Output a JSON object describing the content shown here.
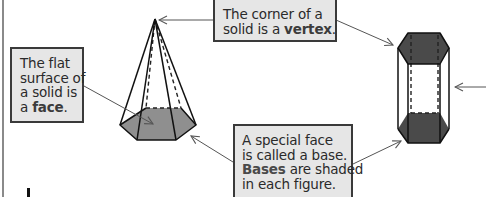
{
  "callouts": {
    "vertex": {
      "line1": "The corner of a",
      "line2_pre": "solid is a ",
      "line2_bold": "vertex",
      "line2_post": "."
    },
    "face": {
      "line1": "The flat",
      "line2": "surface of",
      "line3": "a solid is",
      "line4_pre": "a ",
      "line4_bold": "face",
      "line4_post": "."
    },
    "base": {
      "line1": "A special face",
      "line2": "is called a base.",
      "line3_bold": "Bases",
      "line3_post": " are shaded",
      "line4": "in each figure."
    }
  },
  "figures": {
    "left": "hexagonal-pyramid",
    "right": "hexagonal-prism"
  },
  "colors": {
    "callout_fill": "#e6e6e6",
    "callout_border": "#3a3a3a",
    "pyramid_base": "#8f8f8f",
    "prism_bases": "#4a4a4a",
    "arrow": "#555555"
  }
}
